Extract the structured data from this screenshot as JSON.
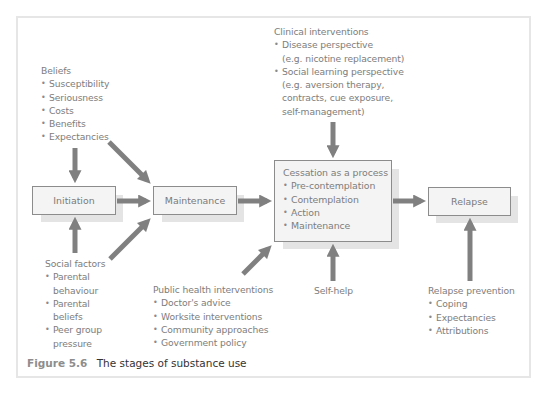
{
  "diagram": {
    "boxes": {
      "initiation": "Initiation",
      "maintenance": "Maintenance",
      "cessation": {
        "title": "Cessation as a process",
        "items": [
          "Pre-contemplation",
          "Contemplation",
          "Action",
          "Maintenance"
        ]
      },
      "relapse": "Relapse"
    },
    "beliefs": {
      "title": "Beliefs",
      "items": [
        "Susceptibility",
        "Seriousness",
        "Costs",
        "Benefits",
        "Expectancies"
      ]
    },
    "social_factors": {
      "title": "Social factors",
      "items": [
        {
          "line1": "Parental",
          "line2": "behaviour"
        },
        {
          "line1": "Parental",
          "line2": "beliefs"
        },
        {
          "line1": "Peer group",
          "line2": "pressure"
        }
      ]
    },
    "clinical_interventions": {
      "title": "Clinical interventions",
      "items": [
        {
          "line1": "Disease perspective",
          "line2": "(e.g. nicotine replacement)"
        },
        {
          "line1": "Social learning perspective",
          "line2": "(e.g. aversion therapy,",
          "line3": "contracts, cue exposure,",
          "line4": "self-management)"
        }
      ]
    },
    "public_health": {
      "title": "Public health interventions",
      "items": [
        "Doctor's advice",
        "Worksite interventions",
        "Community approaches",
        "Government policy"
      ]
    },
    "self_help": "Self-help",
    "relapse_prevention": {
      "title": "Relapse prevention",
      "items": [
        "Coping",
        "Expectancies",
        "Attributions"
      ]
    },
    "arrows": [
      {
        "from": "beliefs",
        "to": "initiation"
      },
      {
        "from": "beliefs",
        "to": "maintenance"
      },
      {
        "from": "social_factors",
        "to": "initiation"
      },
      {
        "from": "social_factors",
        "to": "maintenance"
      },
      {
        "from": "initiation",
        "to": "maintenance"
      },
      {
        "from": "maintenance",
        "to": "cessation"
      },
      {
        "from": "clinical_interventions",
        "to": "cessation"
      },
      {
        "from": "public_health",
        "to": "cessation"
      },
      {
        "from": "self_help",
        "to": "cessation"
      },
      {
        "from": "cessation",
        "to": "relapse"
      },
      {
        "from": "relapse_prevention",
        "to": "relapse"
      }
    ],
    "colors": {
      "arrow": "#808080",
      "box_fill": "#f4f4f4",
      "box_border": "#8c8c8c",
      "shadow": "#e4e4e4",
      "text": "#7d7d7d",
      "frame": "#e6e6e6"
    }
  },
  "caption": {
    "label": "Figure 5.6",
    "title": "The stages of substance use"
  }
}
